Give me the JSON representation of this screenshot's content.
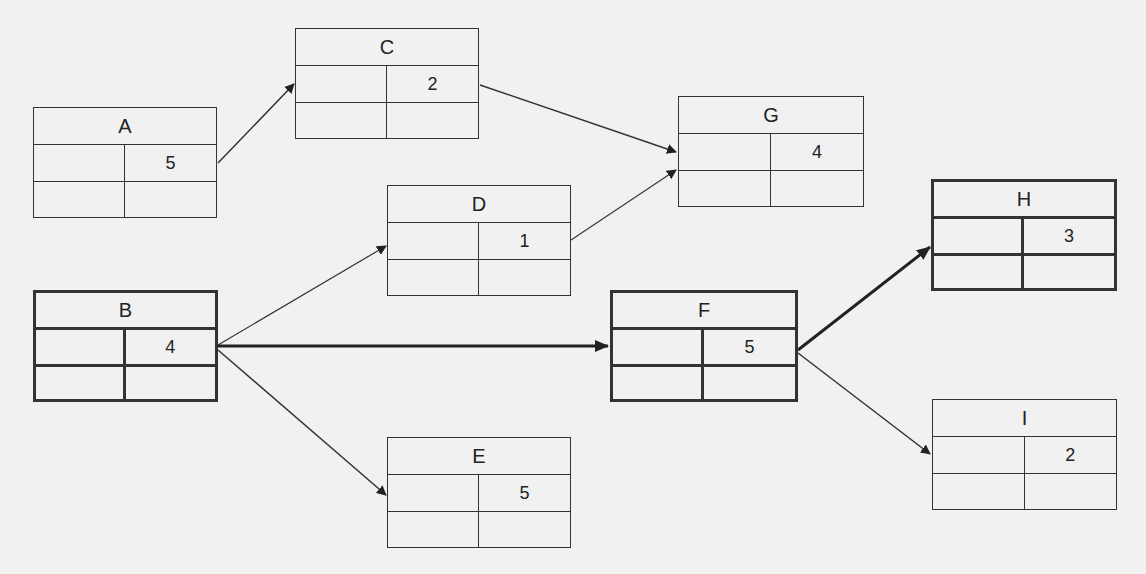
{
  "diagram": {
    "type": "activity-on-node network",
    "nodes": [
      {
        "id": "A",
        "label": "A",
        "duration": "5",
        "critical": false
      },
      {
        "id": "B",
        "label": "B",
        "duration": "4",
        "critical": true
      },
      {
        "id": "C",
        "label": "C",
        "duration": "2",
        "critical": false
      },
      {
        "id": "D",
        "label": "D",
        "duration": "1",
        "critical": false
      },
      {
        "id": "E",
        "label": "E",
        "duration": "5",
        "critical": false
      },
      {
        "id": "F",
        "label": "F",
        "duration": "5",
        "critical": true
      },
      {
        "id": "G",
        "label": "G",
        "duration": "4",
        "critical": false
      },
      {
        "id": "H",
        "label": "H",
        "duration": "3",
        "critical": true
      },
      {
        "id": "I",
        "label": "I",
        "duration": "2",
        "critical": false
      }
    ],
    "edges": [
      {
        "from": "A",
        "to": "C",
        "critical": false
      },
      {
        "from": "C",
        "to": "G",
        "critical": false
      },
      {
        "from": "D",
        "to": "G",
        "critical": false
      },
      {
        "from": "B",
        "to": "D",
        "critical": false
      },
      {
        "from": "B",
        "to": "F",
        "critical": true
      },
      {
        "from": "B",
        "to": "E",
        "critical": false
      },
      {
        "from": "F",
        "to": "H",
        "critical": true
      },
      {
        "from": "F",
        "to": "I",
        "critical": false
      }
    ]
  },
  "nodes": {
    "A": {
      "label": "A",
      "duration": "5"
    },
    "B": {
      "label": "B",
      "duration": "4"
    },
    "C": {
      "label": "C",
      "duration": "2"
    },
    "D": {
      "label": "D",
      "duration": "1"
    },
    "E": {
      "label": "E",
      "duration": "5"
    },
    "F": {
      "label": "F",
      "duration": "5"
    },
    "G": {
      "label": "G",
      "duration": "4"
    },
    "H": {
      "label": "H",
      "duration": "3"
    },
    "I": {
      "label": "I",
      "duration": "2"
    }
  },
  "colors": {
    "line": "#333333",
    "background": "#f1f1f1"
  }
}
